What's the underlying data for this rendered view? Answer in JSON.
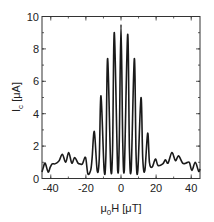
{
  "chart_data": {
    "type": "line",
    "title": "",
    "xlabel": "μ0H [μT]",
    "xlabel_parts": {
      "main": "μ",
      "sub": "0",
      "rest": "H [μT]"
    },
    "ylabel": "Ic [μA]",
    "ylabel_parts": {
      "main": "I",
      "sub": "c",
      "rest": " [μA]"
    },
    "xlim": [
      -45,
      45
    ],
    "ylim": [
      0,
      10
    ],
    "xticks": [
      -40,
      -20,
      0,
      20,
      40
    ],
    "xtick_labels": [
      "-40",
      "-20",
      "0",
      "20",
      "40"
    ],
    "yticks": [
      0,
      2,
      4,
      6,
      8,
      10
    ],
    "ytick_labels": [
      "0",
      "2",
      "4",
      "6",
      "8",
      "10"
    ],
    "x_minor_step": 10,
    "y_minor_step": 1,
    "grid": false,
    "legend": null,
    "line_color": "#1a1a1a",
    "series": [
      {
        "name": "Ic(H)",
        "x": [
          -45,
          -44.2,
          -43.2,
          -41.5,
          -40.3,
          -39.2,
          -38,
          -36.8,
          -35.2,
          -33.4,
          -31.5,
          -29.8,
          -28,
          -26.4,
          -24.5,
          -23.2,
          -22,
          -20.2,
          -18.9,
          -17.3,
          -16.5,
          -15.2,
          -13.6,
          -12.4,
          -11.4,
          -9.6,
          -8.6,
          -7.6,
          -5.8,
          -4.8,
          -3.8,
          -1.9,
          -1.0,
          0,
          1.0,
          1.9,
          3.8,
          4.8,
          5.8,
          7.6,
          8.6,
          9.6,
          11.4,
          12.4,
          13.6,
          15.2,
          16.2,
          17.7,
          19.6,
          21.1,
          23.8,
          25.3,
          26.8,
          29,
          31,
          32.8,
          35.1,
          37,
          38.9,
          40.4,
          42.3,
          44.2,
          45
        ],
        "y": [
          0.4,
          0.7,
          0.95,
          0.4,
          0.7,
          0.9,
          0.9,
          0.95,
          1.1,
          1.5,
          1.0,
          1.6,
          0.95,
          1.3,
          0.95,
          0.9,
          0.9,
          1.3,
          0.3,
          0.5,
          1.2,
          2.9,
          0.5,
          1.2,
          5.1,
          0.5,
          1.4,
          7.4,
          0.5,
          1.8,
          9.0,
          0.5,
          2.2,
          9.5,
          2.2,
          0.5,
          8.9,
          1.8,
          0.5,
          7.4,
          1.4,
          0.5,
          5.0,
          1.2,
          0.5,
          2.8,
          1.0,
          0.7,
          1.2,
          0.8,
          0.9,
          1.15,
          0.95,
          1.6,
          1.1,
          1.4,
          0.95,
          0.95,
          1.0,
          0.5,
          1.0,
          0.45,
          0.6
        ]
      }
    ]
  }
}
